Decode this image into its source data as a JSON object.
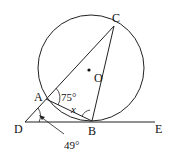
{
  "diagram": {
    "type": "geometry",
    "points": {
      "A": "A",
      "B": "B",
      "C": "C",
      "D": "D",
      "E": "E",
      "O": "O"
    },
    "angles": {
      "CAB": "75°",
      "ADB": "49°",
      "ABC": "x"
    }
  }
}
